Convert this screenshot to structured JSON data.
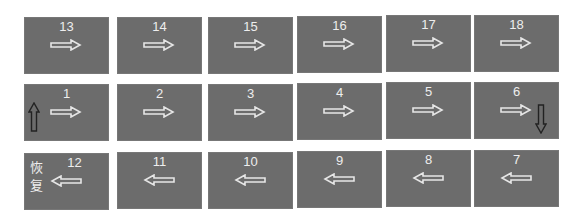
{
  "diagram": {
    "rows": [
      {
        "tiles": [
          {
            "number": "13",
            "arrow": "right"
          },
          {
            "number": "14",
            "arrow": "right"
          },
          {
            "number": "15",
            "arrow": "right"
          },
          {
            "number": "16",
            "arrow": "right"
          },
          {
            "number": "17",
            "arrow": "right"
          },
          {
            "number": "18",
            "arrow": "right"
          }
        ]
      },
      {
        "tiles": [
          {
            "number": "1",
            "arrow": "right",
            "extra_arrow": "up"
          },
          {
            "number": "2",
            "arrow": "right"
          },
          {
            "number": "3",
            "arrow": "right"
          },
          {
            "number": "4",
            "arrow": "right"
          },
          {
            "number": "5",
            "arrow": "right"
          },
          {
            "number": "6",
            "arrow": "right",
            "extra_arrow": "down"
          }
        ]
      },
      {
        "tiles": [
          {
            "number": "12",
            "arrow": "left",
            "label": "恢复"
          },
          {
            "number": "11",
            "arrow": "left"
          },
          {
            "number": "10",
            "arrow": "left"
          },
          {
            "number": "9",
            "arrow": "left"
          },
          {
            "number": "8",
            "arrow": "left"
          },
          {
            "number": "7",
            "arrow": "left"
          }
        ]
      }
    ],
    "restore_label_line1": "恢",
    "restore_label_line2": "复",
    "colors": {
      "tile": "#6c6c6c",
      "text": "#eeeeee",
      "arrow_outline": "#e6e6e6",
      "vertical_arrow": "#222222"
    }
  }
}
